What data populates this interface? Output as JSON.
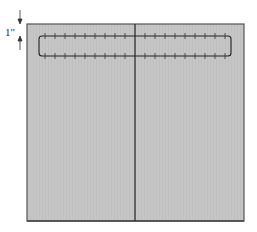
{
  "diagram": {
    "measurement_label": "1\"",
    "panel_fill": "#c4c4c4",
    "line_color": "#2a2a2a"
  }
}
